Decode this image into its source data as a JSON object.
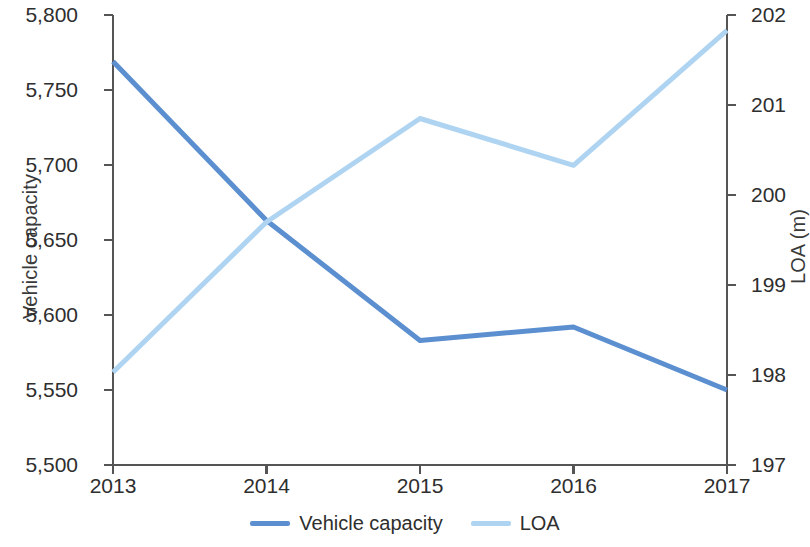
{
  "chart_data": {
    "type": "line",
    "title": "",
    "xlabel": "",
    "ylabel": "Vehicle capacity",
    "y2label": "LOA (m)",
    "categories": [
      "2013",
      "2014",
      "2015",
      "2016",
      "2017"
    ],
    "x_tick_labels": [
      "2013",
      "2014",
      "2015",
      "2016",
      "2017"
    ],
    "y_tick_labels": [
      "5,500",
      "5,550",
      "5,600",
      "5,650",
      "5,700",
      "5,750",
      "5,800"
    ],
    "y_ticks": [
      5500,
      5550,
      5600,
      5650,
      5700,
      5750,
      5800
    ],
    "ylim": [
      5500,
      5800
    ],
    "y2_tick_labels": [
      "197",
      "198",
      "199",
      "200",
      "201",
      "202"
    ],
    "y2_ticks": [
      197,
      198,
      199,
      200,
      201,
      202
    ],
    "y2lim": [
      197,
      202
    ],
    "grid": false,
    "legend_position": "bottom-center",
    "series": [
      {
        "name": "Vehicle capacity",
        "axis": "left",
        "color": "#5B8FD0",
        "values": [
          5769,
          5663,
          5583,
          5592,
          5550
        ]
      },
      {
        "name": "LOA",
        "axis": "right",
        "color": "#AFD4F2",
        "values": [
          198.03,
          199.7,
          200.85,
          200.33,
          201.83
        ]
      }
    ]
  },
  "legend": {
    "items": [
      {
        "label": "Vehicle capacity",
        "color": "#5B8FD0"
      },
      {
        "label": "LOA",
        "color": "#AFD4F2"
      }
    ]
  },
  "axes": {
    "left_title": "Vehicle capacity",
    "right_title": "LOA (m)",
    "axis_color": "#555555"
  }
}
